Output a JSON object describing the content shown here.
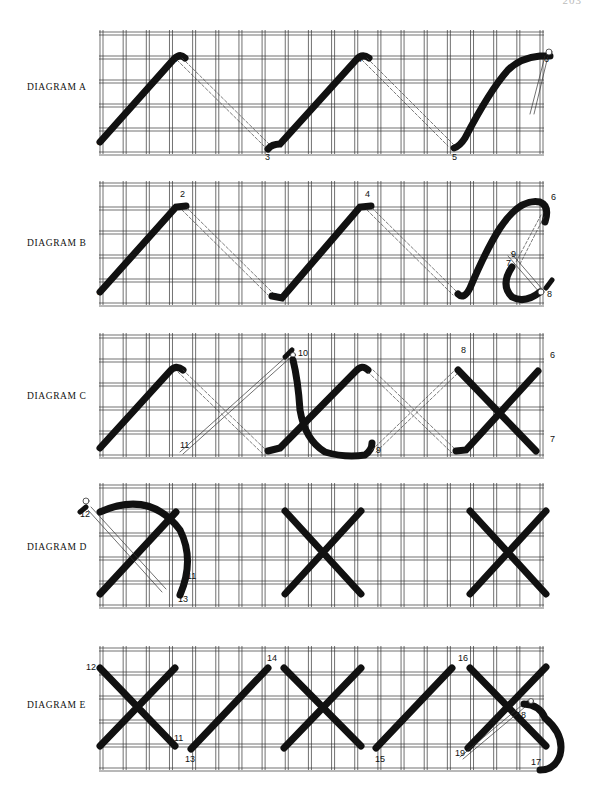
{
  "page": {
    "page_number": "203",
    "grid": {
      "left": 100,
      "right": 540,
      "columns": 19,
      "rows": 5,
      "line_color": "#333333",
      "thread_color": "#111111"
    }
  },
  "diagrams": [
    {
      "id": "A",
      "label": "DIAGRAM A",
      "top": 32,
      "height": 120,
      "label_y": 88,
      "numbers": [
        {
          "t": "1",
          "x": 97,
          "y": 145
        },
        {
          "t": "2",
          "x": 172,
          "y": 62
        },
        {
          "t": "3",
          "x": 265,
          "y": 160
        },
        {
          "t": "4",
          "x": 357,
          "y": 62
        },
        {
          "t": "5",
          "x": 452,
          "y": 160
        },
        {
          "t": "6",
          "x": 544,
          "y": 62
        }
      ]
    },
    {
      "id": "B",
      "label": "DIAGRAM B",
      "top": 183,
      "height": 120,
      "label_y": 245,
      "numbers": [
        {
          "t": "1",
          "x": 97,
          "y": 295
        },
        {
          "t": "2",
          "x": 180,
          "y": 197
        },
        {
          "t": "3",
          "x": 272,
          "y": 299
        },
        {
          "t": "4",
          "x": 365,
          "y": 197
        },
        {
          "t": "5",
          "x": 460,
          "y": 299
        },
        {
          "t": "6",
          "x": 551,
          "y": 200
        },
        {
          "t": "7",
          "x": 506,
          "y": 266
        },
        {
          "t": "8",
          "x": 547,
          "y": 297
        },
        {
          "t": "9",
          "x": 511,
          "y": 257
        }
      ]
    },
    {
      "id": "C",
      "label": "DIAGRAM C",
      "top": 335,
      "height": 120,
      "label_y": 397,
      "numbers": [
        {
          "t": "10",
          "x": 298,
          "y": 356
        },
        {
          "t": "11",
          "x": 180,
          "y": 448
        },
        {
          "t": "9",
          "x": 376,
          "y": 453
        },
        {
          "t": "8",
          "x": 461,
          "y": 353
        },
        {
          "t": "6",
          "x": 550,
          "y": 358
        },
        {
          "t": "7",
          "x": 550,
          "y": 442
        }
      ]
    },
    {
      "id": "D",
      "label": "DIAGRAM D",
      "top": 485,
      "height": 120,
      "label_y": 548,
      "numbers": [
        {
          "t": "12",
          "x": 80,
          "y": 517
        },
        {
          "t": "11",
          "x": 187,
          "y": 579
        },
        {
          "t": "13",
          "x": 178,
          "y": 602
        }
      ]
    },
    {
      "id": "E",
      "label": "DIAGRAM E",
      "top": 648,
      "height": 120,
      "label_y": 706,
      "numbers": [
        {
          "t": "12",
          "x": 86,
          "y": 670
        },
        {
          "t": "11",
          "x": 174,
          "y": 741
        },
        {
          "t": "13",
          "x": 185,
          "y": 762
        },
        {
          "t": "14",
          "x": 267,
          "y": 661
        },
        {
          "t": "15",
          "x": 375,
          "y": 762
        },
        {
          "t": "16",
          "x": 458,
          "y": 661
        },
        {
          "t": "18",
          "x": 516,
          "y": 718
        },
        {
          "t": "19",
          "x": 455,
          "y": 756
        },
        {
          "t": "17",
          "x": 531,
          "y": 765
        }
      ]
    }
  ]
}
